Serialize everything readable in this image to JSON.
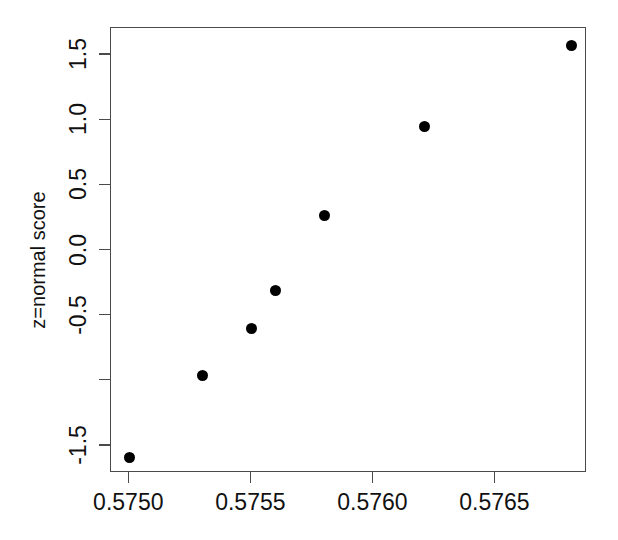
{
  "chart_data": {
    "type": "scatter",
    "title": "",
    "subtitle": "",
    "xlabel": "",
    "ylabel": "z=normal score",
    "xlim": [
      0.574925,
      0.576875
    ],
    "ylim": [
      -1.7077,
      1.7077
    ],
    "grid": false,
    "legend": null,
    "annotations": [],
    "x_ticks": [
      {
        "value": 0.575,
        "label": "0.5750"
      },
      {
        "value": 0.5755,
        "label": "0.5755"
      },
      {
        "value": 0.576,
        "label": "0.5760"
      },
      {
        "value": 0.5765,
        "label": "0.5765"
      }
    ],
    "y_ticks": [
      {
        "value": 1.5,
        "label": "1.5"
      },
      {
        "value": 1.0,
        "label": "1.0"
      },
      {
        "value": 0.5,
        "label": "0.5"
      },
      {
        "value": 0.0,
        "label": "0.0"
      },
      {
        "value": -0.5,
        "label": "-0.5"
      },
      {
        "value": -1.0,
        "label": ""
      },
      {
        "value": -1.5,
        "label": "-1.5"
      }
    ],
    "series": [
      {
        "name": "normal scores",
        "marker": "filled-circle",
        "color": "#000000",
        "points": [
          {
            "x": 0.575,
            "y": -1.59
          },
          {
            "x": 0.5753,
            "y": -0.96
          },
          {
            "x": 0.5755,
            "y": -0.6
          },
          {
            "x": 0.5756,
            "y": -0.31
          },
          {
            "x": 0.5758,
            "y": 0.27
          },
          {
            "x": 0.57621,
            "y": 0.95
          },
          {
            "x": 0.57681,
            "y": 1.57
          }
        ]
      }
    ],
    "x": [
      0.575,
      0.5753,
      0.5755,
      0.5756,
      0.5758,
      0.57621,
      0.57681
    ],
    "values": [
      -1.59,
      -0.96,
      -0.6,
      -0.31,
      0.27,
      0.95,
      1.57
    ],
    "colors": {
      "marker": "#000000",
      "axis": "#4a4a4a",
      "text": "#111111",
      "background": "#ffffff"
    }
  }
}
